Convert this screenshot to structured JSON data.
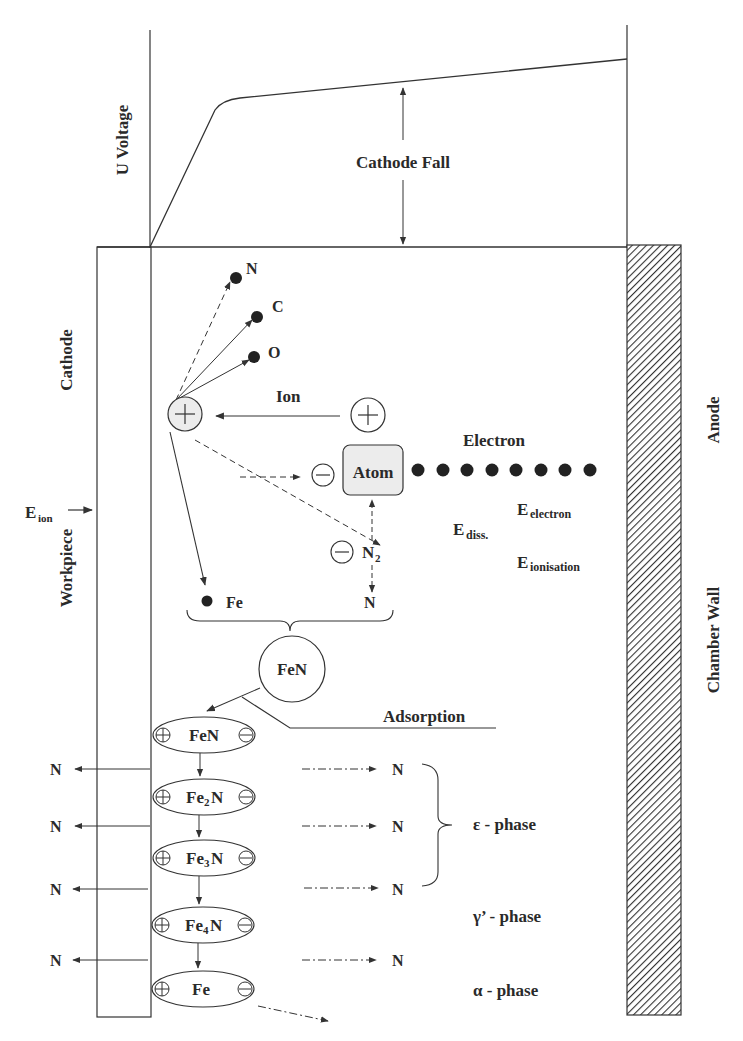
{
  "diagram": {
    "voltage_plot": {
      "ylabel": "U Voltage",
      "annotation": "Cathode Fall"
    },
    "regions": {
      "cathode": "Cathode",
      "workpiece": "Workpiece",
      "anode": "Anode",
      "chamber_wall": "Chamber Wall"
    },
    "energy_labels": {
      "ion": {
        "E": "E",
        "sub": "ion"
      },
      "electron": {
        "E": "E",
        "sub": "electron"
      },
      "dissociation": {
        "E": "E",
        "sub": "diss."
      },
      "ionisation": {
        "E": "E",
        "sub": "ionisation"
      }
    },
    "particles": {
      "sputtered": [
        "N",
        "C",
        "O"
      ],
      "ion_label": "Ion",
      "electron_label": "Electron",
      "atom_label": "Atom",
      "n2_label": {
        "base": "N",
        "sub": "2"
      },
      "fe_label": "Fe",
      "n_label": "N",
      "fen_circle": "FeN",
      "adsorption": "Adsorption",
      "plus_symbol": "+",
      "minus_symbol": "−"
    },
    "compounds": [
      {
        "base": "FeN",
        "sub": ""
      },
      {
        "base": "Fe",
        "sub": "2",
        "tail": "N"
      },
      {
        "base": "Fe",
        "sub": "3",
        "tail": "N"
      },
      {
        "base": "Fe",
        "sub": "4",
        "tail": "N"
      },
      {
        "base": "Fe",
        "sub": "",
        "tail": ""
      }
    ],
    "diffusion": {
      "left_labels": [
        "N",
        "N",
        "N",
        "N"
      ],
      "right_labels": [
        "N",
        "N",
        "N",
        "N"
      ]
    },
    "phases": {
      "epsilon": "ε - phase",
      "gamma": "γ’ - phase",
      "alpha": "α - phase"
    },
    "colors": {
      "line": "#333333",
      "circle_fill": "#ececec",
      "hatch": "#333333"
    }
  }
}
